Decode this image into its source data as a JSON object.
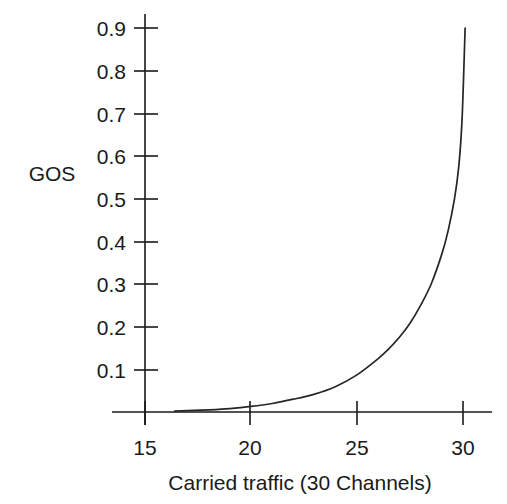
{
  "chart_data": {
    "type": "line",
    "title": "",
    "xlabel": "Carried traffic (30 Channels)",
    "ylabel": "GOS",
    "xlim": [
      13.5,
      31.5
    ],
    "ylim": [
      0.0,
      0.96
    ],
    "grid": false,
    "legend": null,
    "xticks": [
      15,
      20,
      25,
      30
    ],
    "xtick_labels": [
      "15",
      "20",
      "25",
      "30"
    ],
    "yticks": [
      0.1,
      0.2,
      0.3,
      0.4,
      0.5,
      0.6,
      0.7,
      0.8,
      0.9
    ],
    "ytick_labels": [
      "0.1",
      "0.2",
      "0.3",
      "0.4",
      "0.5",
      "0.6",
      "0.7",
      "0.8",
      "0.9"
    ],
    "series": [
      {
        "name": "GOS vs carried traffic",
        "color": "#262626",
        "x": [
          16.4,
          17.0,
          18.0,
          19.0,
          20.0,
          21.0,
          22.0,
          23.0,
          24.0,
          25.0,
          26.0,
          26.5,
          27.0,
          27.5,
          28.0,
          28.5,
          29.0,
          29.3,
          29.6,
          29.8,
          29.95,
          30.05,
          30.1
        ],
        "y": [
          0.002,
          0.003,
          0.005,
          0.008,
          0.013,
          0.02,
          0.03,
          0.042,
          0.06,
          0.087,
          0.125,
          0.148,
          0.175,
          0.208,
          0.25,
          0.3,
          0.37,
          0.425,
          0.5,
          0.575,
          0.68,
          0.82,
          0.9
        ]
      }
    ]
  },
  "labels": {
    "y_axis_title": "GOS",
    "x_axis_title": "Carried traffic (30 Channels)"
  }
}
